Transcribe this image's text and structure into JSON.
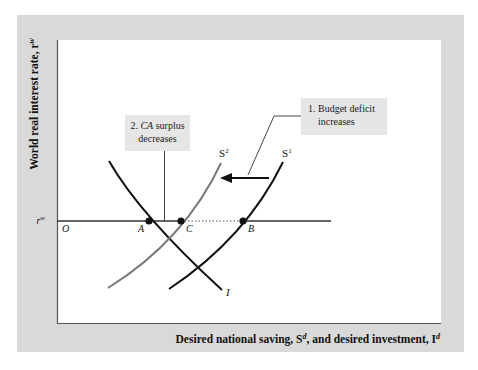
{
  "colors": {
    "panel": "#d9d9d9",
    "plot_bg": "#ffffff",
    "axis": "#555555",
    "curve_dark": "#111111",
    "curve_gray": "#7a7a7a",
    "callout_bg": "#e6e6e6"
  },
  "axes": {
    "y_label": "World real interest rate, r",
    "y_label_sup": "w",
    "x_label_pre": "Desired national saving, S",
    "x_label_sup1": "d",
    "x_label_mid": ", and desired investment, I",
    "x_label_sup2": "d",
    "origin_label": "O",
    "rw_label": "r",
    "rw_sup": "w"
  },
  "curves": {
    "s1_label": "S",
    "s1_sup": "1",
    "s2_label": "S",
    "s2_sup": "2",
    "i_label": "I"
  },
  "points": {
    "a": "A",
    "b": "B",
    "c": "C"
  },
  "callouts": {
    "budget_line1": "1. Budget deficit",
    "budget_line2": "increases",
    "ca_line1_num": "2. ",
    "ca_line1_ital": "CA",
    "ca_line1_rest": " surplus",
    "ca_line2": "decreases"
  }
}
